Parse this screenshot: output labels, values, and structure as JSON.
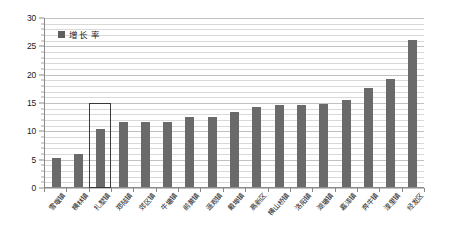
{
  "chart_data": {
    "type": "bar",
    "title": "",
    "xlabel": "",
    "ylabel": "",
    "ylim": [
      0,
      30
    ],
    "ytick_labels": [
      "0",
      "5",
      "10",
      "15",
      "20",
      "25",
      "30"
    ],
    "ytick_values": [
      0,
      5,
      10,
      15,
      20,
      25,
      30
    ],
    "grid": "horizontal-minor-every-1",
    "legend_position": "top-left-inside",
    "legend": [
      "增长 率"
    ],
    "categories": [
      "雪堰镇",
      "横林镇",
      "扎墅镇",
      "郑陆镇",
      "郊区镇",
      "牛塘镇",
      "前黄镇",
      "遥观镇",
      "戴埠镇",
      "高新区",
      "横山桥镇",
      "洛阳镇",
      "湖塘镇",
      "嘉泽镇",
      "奔牛镇",
      "湟里镇",
      "经发区"
    ],
    "values": [
      5.2,
      5.8,
      10.3,
      11.4,
      11.4,
      11.5,
      12.3,
      12.4,
      13.2,
      14.1,
      14.4,
      14.5,
      14.6,
      15.3,
      17.5,
      19.0,
      26.0
    ],
    "series": [
      {
        "name": "增长 率",
        "color": "#6a6a6a",
        "values": [
          5.2,
          5.8,
          10.3,
          11.4,
          11.4,
          11.5,
          12.3,
          12.4,
          13.2,
          14.1,
          14.4,
          14.5,
          14.6,
          15.3,
          17.5,
          19.0,
          26.0
        ]
      }
    ],
    "annotations": [
      {
        "type": "highlight-rectangle",
        "target_category": "扎墅镇",
        "target_index": 2,
        "color": "#3a3a3a",
        "y_range": [
          0,
          15
        ]
      }
    ]
  },
  "colors": {
    "bar": "#6a6a6a",
    "legend_swatch": "#5f5f5f",
    "gridline": "#d9d9d9",
    "axis": "#8a8a8a",
    "highlight": "#3a3a3a",
    "background": "#ffffff",
    "text": "#1a1a1a"
  }
}
